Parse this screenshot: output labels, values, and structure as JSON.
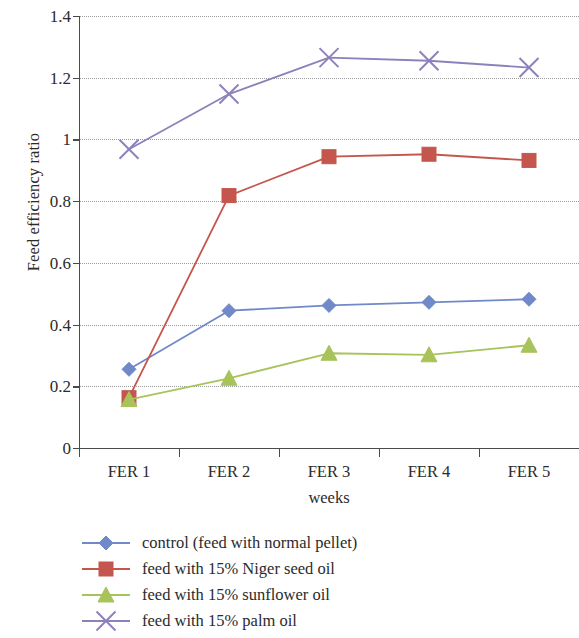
{
  "chart_data": {
    "type": "line",
    "title": "",
    "xlabel": "weeks",
    "ylabel": "Feed efficiency ratio",
    "categories": [
      "FER 1",
      "FER 2",
      "FER 3",
      "FER 4",
      "FER 5"
    ],
    "ylim": [
      0,
      1.4
    ],
    "yticks": [
      0,
      0.2,
      0.4,
      0.6,
      0.8,
      1,
      1.2,
      1.4
    ],
    "ytick_labels": [
      "0",
      "0.2",
      "0.4",
      "0.6",
      "0.8",
      "1",
      "1.2",
      "1.4"
    ],
    "grid": "horizontal-dotted",
    "legend_position": "below",
    "series": [
      {
        "name": "control (feed with normal pellet)",
        "color": "#7089c8",
        "marker": "diamond",
        "values": [
          0.255,
          0.445,
          0.462,
          0.472,
          0.482
        ]
      },
      {
        "name": "feed with 15% Niger seed oil",
        "color": "#c4564d",
        "marker": "square",
        "values": [
          0.163,
          0.818,
          0.944,
          0.952,
          0.932
        ]
      },
      {
        "name": "feed with 15% sunflower oil",
        "color": "#a8c35a",
        "marker": "triangle",
        "values": [
          0.157,
          0.226,
          0.307,
          0.302,
          0.333
        ]
      },
      {
        "name": "feed with 15% palm oil",
        "color": "#8e81bb",
        "marker": "cross",
        "values": [
          0.968,
          1.147,
          1.265,
          1.255,
          1.233
        ]
      }
    ]
  },
  "axes": {
    "y_title": "Feed efficiency ratio",
    "x_title": "weeks"
  },
  "legend": {
    "items": [
      "control (feed with normal pellet)",
      "feed with 15% Niger seed oil",
      "feed with 15% sunflower oil",
      "feed with 15% palm oil"
    ]
  }
}
